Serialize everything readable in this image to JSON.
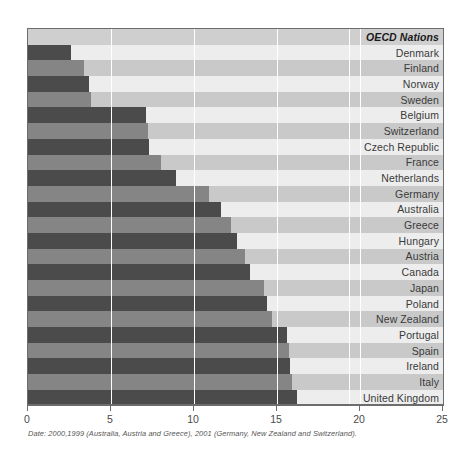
{
  "chart_data": {
    "type": "bar",
    "orientation": "horizontal",
    "title": "",
    "header_label": "OECD Nations",
    "xlabel": "",
    "ylabel": "",
    "xlim": [
      0,
      25
    ],
    "xticks": [
      0,
      5,
      10,
      15,
      20,
      25
    ],
    "xtick_labels": [
      "0",
      "5",
      "10",
      "15",
      "20",
      "25"
    ],
    "grid": true,
    "gridlines_at": [
      5,
      10,
      15,
      20
    ],
    "legend": "none",
    "categories": [
      "Denmark",
      "Finland",
      "Norway",
      "Sweden",
      "Belgium",
      "Switzerland",
      "Czech Republic",
      "France",
      "Netherlands",
      "Germany",
      "Australia",
      "Greece",
      "Hungary",
      "Austria",
      "Canada",
      "Japan",
      "Poland",
      "New Zealand",
      "Portugal",
      "Spain",
      "Ireland",
      "Italy",
      "United Kingdom",
      "United States"
    ],
    "values": [
      2.6,
      3.4,
      3.7,
      3.8,
      7.1,
      7.2,
      7.3,
      8.0,
      8.9,
      10.9,
      11.6,
      12.2,
      12.6,
      13.1,
      13.4,
      14.2,
      14.4,
      14.7,
      15.6,
      15.7,
      15.8,
      15.9,
      16.2,
      22.1
    ],
    "annotations": [
      "Date: 2000,1999 (Australia, Austria and Greece), 2001 (Germany, New Zealand and Switzerland)."
    ],
    "colors": {
      "bar_dark": "#4b4b4b",
      "bar_light": "#858585",
      "row_odd": "#ededed",
      "row_even": "#c9c9c9",
      "header_row": "#cfcfcf",
      "gridline": "#ffffff",
      "axis": "#6d6d6d",
      "text": "#3a3a3a"
    }
  },
  "footnote": "Date: 2000,1999 (Australia, Austria and Greece), 2001 (Germany, New Zealand and Switzerland)."
}
